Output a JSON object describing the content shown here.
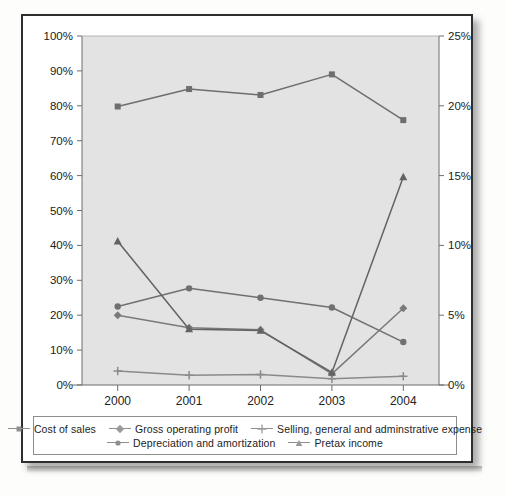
{
  "chart_data": {
    "type": "line",
    "title": "",
    "xlabel": "",
    "ylabel": "",
    "categories": [
      "2000",
      "2001",
      "2002",
      "2003",
      "2004"
    ],
    "grid": false,
    "legend_position": "bottom",
    "axes": {
      "left": {
        "label": "",
        "ylim": [
          0,
          100
        ],
        "ticks": [
          "0%",
          "10%",
          "20%",
          "30%",
          "40%",
          "50%",
          "60%",
          "70%",
          "80%",
          "90%",
          "100%"
        ],
        "tick_values": [
          0,
          10,
          20,
          30,
          40,
          50,
          60,
          70,
          80,
          90,
          100
        ]
      },
      "right": {
        "label": "",
        "ylim": [
          0,
          25
        ],
        "ticks": [
          "0%",
          "5%",
          "10%",
          "15%",
          "20%",
          "25%"
        ],
        "tick_values": [
          0,
          5,
          10,
          15,
          20,
          25
        ]
      }
    },
    "series": [
      {
        "name": "Cost of sales",
        "axis": "left",
        "marker": "square",
        "color": "#6e6e6e",
        "values": [
          79.8,
          84.8,
          83.1,
          89.0,
          75.9
        ]
      },
      {
        "name": "Gross operating profit",
        "axis": "left",
        "marker": "diamond",
        "color": "#7a7a7a",
        "values": [
          20.0,
          16.4,
          15.8,
          3.2,
          22.0
        ]
      },
      {
        "name": "Selling, general and adminstrative expense",
        "axis": "left",
        "marker": "plus",
        "color": "#8a8a8a",
        "values": [
          4.0,
          2.8,
          3.0,
          1.8,
          2.5
        ]
      },
      {
        "name": "Depreciation and amortization",
        "axis": "left",
        "marker": "circle",
        "color": "#707070",
        "values": [
          22.5,
          27.7,
          25.0,
          22.2,
          12.3
        ]
      },
      {
        "name": "Pretax income",
        "axis": "right",
        "marker": "triangle",
        "color": "#636363",
        "values": [
          10.3,
          4.0,
          3.9,
          0.9,
          14.9
        ]
      }
    ]
  },
  "legend": {
    "rows": [
      [
        {
          "label": "Cost of sales",
          "marker": "square"
        },
        {
          "label": "Gross operating profit",
          "marker": "diamond"
        },
        {
          "label": "Selling, general and adminstrative expense",
          "marker": "plus"
        }
      ],
      [
        {
          "label": "Depreciation and amortization",
          "marker": "circle"
        },
        {
          "label": "Pretax income",
          "marker": "triangle"
        }
      ]
    ]
  },
  "style": {
    "plot_bg": "#e3e3e3",
    "frame": "#2e2e2e",
    "axis": "#6d6d6d",
    "tick_text": "#222222"
  }
}
